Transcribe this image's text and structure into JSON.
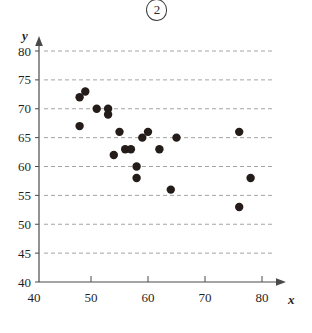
{
  "figure": {
    "number_label": "2",
    "badge_name": "circled-figure-number"
  },
  "chart_data": {
    "type": "scatter",
    "title": "",
    "xlabel": "x",
    "ylabel": "y",
    "xlim": [
      40,
      82
    ],
    "ylim": [
      40,
      82
    ],
    "xticks": [
      40,
      50,
      60,
      70,
      80
    ],
    "yticks": [
      40,
      45,
      50,
      55,
      60,
      65,
      70,
      75,
      80
    ],
    "xtick_labels": [
      "40",
      "50",
      "60",
      "70",
      "80"
    ],
    "ytick_labels": [
      "40",
      "45",
      "50",
      "55",
      "60",
      "65",
      "70",
      "75",
      "80"
    ],
    "grid": "horizontal-dashed",
    "legend": null,
    "marker_color": "#241c18",
    "marker_size": 4.2,
    "points": [
      {
        "x": 48,
        "y": 67
      },
      {
        "x": 48,
        "y": 72
      },
      {
        "x": 49,
        "y": 73
      },
      {
        "x": 51,
        "y": 70
      },
      {
        "x": 53,
        "y": 70
      },
      {
        "x": 53,
        "y": 69
      },
      {
        "x": 54,
        "y": 62
      },
      {
        "x": 55,
        "y": 66
      },
      {
        "x": 56,
        "y": 63
      },
      {
        "x": 57,
        "y": 63
      },
      {
        "x": 58,
        "y": 58
      },
      {
        "x": 58,
        "y": 60
      },
      {
        "x": 59,
        "y": 65
      },
      {
        "x": 60,
        "y": 66
      },
      {
        "x": 62,
        "y": 63
      },
      {
        "x": 64,
        "y": 56
      },
      {
        "x": 65,
        "y": 65
      },
      {
        "x": 76,
        "y": 66
      },
      {
        "x": 76,
        "y": 53
      },
      {
        "x": 78,
        "y": 58
      }
    ]
  },
  "colors": {
    "axis": "#4a4a4a",
    "grid": "#9a9a9a",
    "marker": "#241c18",
    "text": "#1f1f1f",
    "background": "#ffffff"
  }
}
